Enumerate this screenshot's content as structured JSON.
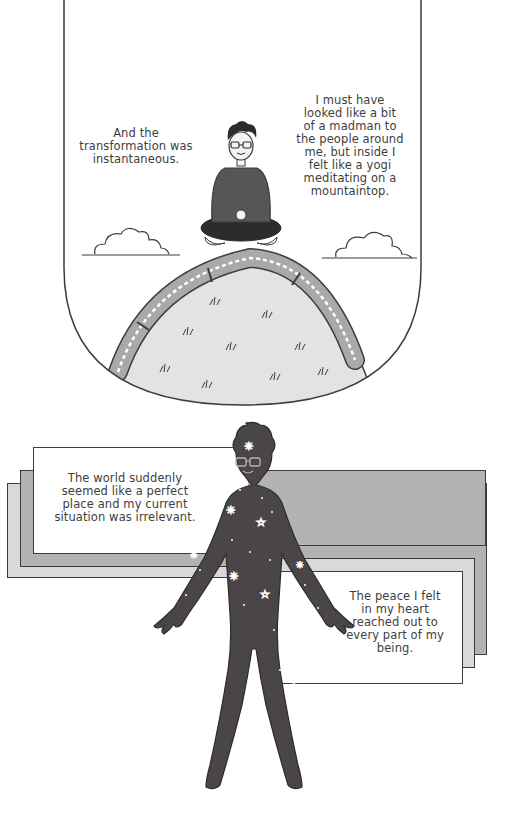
{
  "panel_top": {
    "caption_left": "And the transformation was instantaneous.",
    "caption_left_lines": [
      "And the",
      "transformation was",
      "instantaneous."
    ],
    "caption_right": "I must have looked like a bit of a madman to the people around me, but inside I felt like a yogi meditating on a mountaintop.",
    "caption_right_lines": [
      "I must have",
      "looked like a bit",
      "of a madman to",
      "the people around",
      "me, but inside I",
      "felt like a yogi",
      "meditating on a",
      "mountaintop."
    ],
    "scene": "person-meditating-on-train-covered-hill"
  },
  "panel_bottom": {
    "caption_top": "The world suddenly seemed like a perfect place and my current situation was irrelevant.",
    "caption_top_lines": [
      "The world suddenly",
      "seemed like a perfect",
      "place and my current",
      "situation was irrelevant."
    ],
    "caption_bottom": "The peace I felt in my heart reached out to every part of my being.",
    "caption_bottom_lines": [
      "The peace I felt",
      "in my heart",
      "reached out to",
      "every part of my",
      "being."
    ],
    "scene": "starry-silhouette-figure"
  },
  "colors": {
    "ink": "#3c3c3c",
    "figure": "#4a4548",
    "hill": "#e2e2e2",
    "train": "#a9a9a9",
    "box_dark": "#b3b3b3",
    "box_light": "#d9d9d9",
    "page": "#ffffff"
  }
}
